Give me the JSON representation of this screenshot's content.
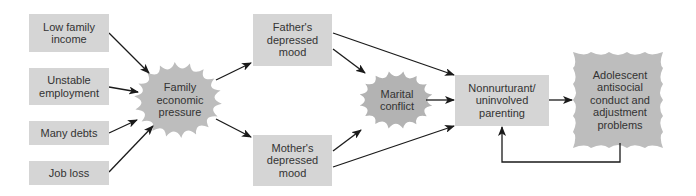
{
  "diagram": {
    "type": "path-model",
    "colors": {
      "box_fill": "#d5d5d5",
      "burst_fill": "#bdbdbd",
      "marital_burst_fill": "#b3b3b3",
      "arrow": "#1a1a1a",
      "text": "#333333"
    },
    "stressors": [
      {
        "id": "low_income",
        "label": "Low family\nincome"
      },
      {
        "id": "unstable_employment",
        "label": "Unstable\nemployment"
      },
      {
        "id": "many_debts",
        "label": "Many debts"
      },
      {
        "id": "job_loss",
        "label": "Job loss"
      }
    ],
    "family_pressure": {
      "label": "Family\neconomic\npressure"
    },
    "fathers_mood": {
      "label": "Father's\ndepressed\nmood"
    },
    "mothers_mood": {
      "label": "Mother's\ndepressed\nmood"
    },
    "marital_conflict": {
      "label": "Marital\nconflict"
    },
    "parenting": {
      "label": "Nonnurturant/\nuninvolved\nparenting"
    },
    "outcome": {
      "label": "Adolescent\nantisocial\nconduct and\nadjustment\nproblems"
    },
    "edges": [
      {
        "from": "Low family income",
        "to": "Family economic pressure"
      },
      {
        "from": "Unstable employment",
        "to": "Family economic pressure"
      },
      {
        "from": "Many debts",
        "to": "Family economic pressure"
      },
      {
        "from": "Job loss",
        "to": "Family economic pressure"
      },
      {
        "from": "Family economic pressure",
        "to": "Father's depressed mood"
      },
      {
        "from": "Family economic pressure",
        "to": "Mother's depressed mood"
      },
      {
        "from": "Father's depressed mood",
        "to": "Marital conflict"
      },
      {
        "from": "Father's depressed mood",
        "to": "Nonnurturant/uninvolved parenting"
      },
      {
        "from": "Mother's depressed mood",
        "to": "Marital conflict"
      },
      {
        "from": "Mother's depressed mood",
        "to": "Nonnurturant/uninvolved parenting"
      },
      {
        "from": "Marital conflict",
        "to": "Nonnurturant/uninvolved parenting"
      },
      {
        "from": "Nonnurturant/uninvolved parenting",
        "to": "Adolescent antisocial conduct and adjustment problems"
      },
      {
        "from": "Adolescent antisocial conduct and adjustment problems",
        "to": "Nonnurturant/uninvolved parenting"
      }
    ]
  }
}
